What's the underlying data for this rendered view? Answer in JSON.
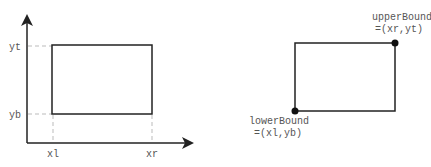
{
  "left_diagram": {
    "y_labels": {
      "top": "yt",
      "bottom": "yb"
    },
    "x_labels": {
      "left": "xl",
      "right": "xr"
    }
  },
  "right_diagram": {
    "upper": {
      "name": "upperBound",
      "value": "=(xr,yt)"
    },
    "lower": {
      "name": "lowerBound",
      "value": "=(xl,yb)"
    }
  },
  "colors": {
    "stroke": "#222222",
    "guide": "#bbbbbb",
    "text": "#555555"
  }
}
